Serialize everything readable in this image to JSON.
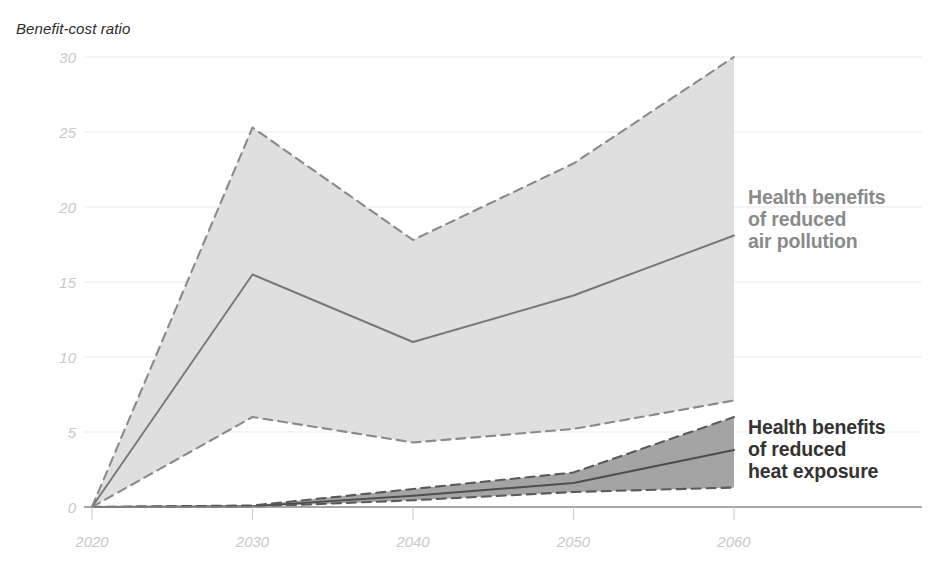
{
  "chart_data": {
    "type": "area",
    "title": "",
    "ylabel": "Benefit-cost ratio",
    "xlabel": "",
    "x": [
      2020,
      2030,
      2040,
      2050,
      2060
    ],
    "xticks": [
      "2020",
      "2030",
      "2040",
      "2050",
      "2060"
    ],
    "yticks": [
      "0",
      "5",
      "10",
      "15",
      "20",
      "25",
      "30"
    ],
    "ylim": [
      0,
      30
    ],
    "xlim": [
      2020,
      2060
    ],
    "grid": true,
    "legend_position": "right-inline-annotations",
    "series": [
      {
        "name": "Health benefits of reduced air pollution",
        "role": "upper-bound",
        "style": "dashed",
        "color": "#8a8a8a",
        "values": [
          0.0,
          25.3,
          17.8,
          22.9,
          30.0
        ]
      },
      {
        "name": "Health benefits of reduced air pollution",
        "role": "median",
        "style": "solid",
        "color": "#777777",
        "values": [
          0.0,
          15.5,
          11.0,
          14.1,
          18.1
        ]
      },
      {
        "name": "Health benefits of reduced air pollution",
        "role": "lower-bound",
        "style": "dashed",
        "color": "#8a8a8a",
        "values": [
          0.0,
          6.0,
          4.3,
          5.2,
          7.1
        ]
      },
      {
        "name": "Health benefits of reduced heat exposure",
        "role": "upper-bound",
        "style": "dashed",
        "color": "#5a5a5a",
        "values": [
          0.0,
          0.1,
          1.2,
          2.3,
          6.0
        ]
      },
      {
        "name": "Health benefits of reduced heat exposure",
        "role": "median",
        "style": "solid",
        "color": "#4d4d4d",
        "values": [
          0.0,
          0.05,
          0.75,
          1.6,
          3.8
        ]
      },
      {
        "name": "Health benefits of reduced heat exposure",
        "role": "lower-bound",
        "style": "dashed",
        "color": "#5a5a5a",
        "values": [
          0.0,
          0.02,
          0.45,
          1.0,
          1.3
        ]
      }
    ],
    "bands": [
      {
        "name": "air-pollution-band",
        "fill": "#d9d9d9",
        "opacity": 0.85,
        "upper_ref": 0,
        "lower_ref": 2
      },
      {
        "name": "heat-exposure-band",
        "fill": "#9a9a9a",
        "opacity": 0.9,
        "upper_ref": 3,
        "lower_ref": 5
      }
    ],
    "colors": {
      "grid": "#ececec",
      "axis": "#8a8a8a",
      "tick_text": "#c9c9c9",
      "air_band_fill": "#d9d9d9",
      "heat_band_fill": "#9a9a9a",
      "air_label": "#8a8a8a",
      "heat_label": "#333333",
      "background": "#ffffff"
    }
  },
  "annotations": {
    "air_pollution_label": "Health benefits\nof reduced\nair pollution",
    "heat_exposure_label": "Health benefits\nof reduced\nheat exposure"
  }
}
